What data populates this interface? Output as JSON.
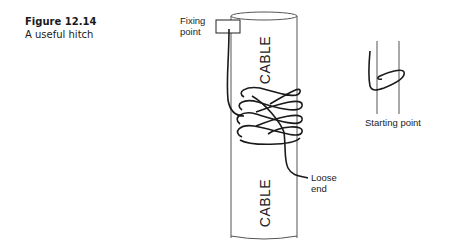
{
  "figure": {
    "number": "Figure 12.14",
    "title": "A useful hitch"
  },
  "diagram": {
    "cable_label_top": "CABLE",
    "cable_label_bottom": "CABLE",
    "fixing_point_line1": "Fixing",
    "fixing_point_line2": "point",
    "loose_end_line1": "Loose",
    "loose_end_line2": "end",
    "starting_point": "Starting point"
  },
  "colors": {
    "line": "#1a1a1a",
    "cable_outline": "#555555",
    "background": "#ffffff"
  }
}
